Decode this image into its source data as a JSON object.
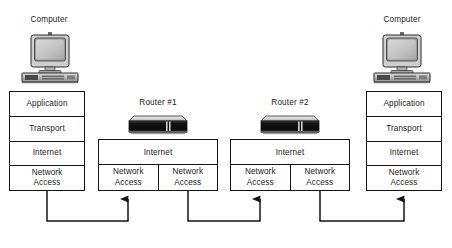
{
  "diagram": {
    "background_color": "#ffffff",
    "line_color": "#141414",
    "text_color": "#1d1d1d",
    "nodes": [
      {
        "id": "computer-a",
        "caption": "Computer\nA",
        "caption_line1": "Computer",
        "caption_line2": "A",
        "icon": "desktop-computer-icon",
        "layers": [
          "Application",
          "Transport",
          "Internet",
          "Network\nAccess"
        ]
      },
      {
        "id": "router-1",
        "caption": "Router #1",
        "icon": "router-icon",
        "internet_label": "Internet",
        "network_access_left": "Network\nAccess",
        "network_access_right": "Network\nAccess"
      },
      {
        "id": "router-2",
        "caption": "Router #2",
        "icon": "router-icon",
        "internet_label": "Internet",
        "network_access_left": "Network\nAccess",
        "network_access_right": "Network\nAccess"
      },
      {
        "id": "computer-b",
        "caption": "Computer\nB",
        "caption_line1": "Computer",
        "caption_line2": "B",
        "icon": "desktop-computer-icon",
        "layers": [
          "Application",
          "Transport",
          "Internet",
          "Network\nAccess"
        ]
      }
    ],
    "stack_a": {
      "layer_application": "Application",
      "layer_transport": "Transport",
      "layer_internet": "Internet",
      "layer_network_access": "Network\nAccess"
    },
    "stack_b": {
      "layer_application": "Application",
      "layer_transport": "Transport",
      "layer_internet": "Internet",
      "layer_network_access": "Network\nAccess"
    },
    "router1": {
      "caption": "Router #1",
      "internet": "Internet",
      "na_left": "Network\nAccess",
      "na_right": "Network\nAccess"
    },
    "router2": {
      "caption": "Router #2",
      "internet": "Internet",
      "na_left": "Network\nAccess",
      "na_right": "Network\nAccess"
    },
    "computer_a": {
      "caption_line1": "Computer",
      "caption_line2": "A"
    },
    "computer_b": {
      "caption_line1": "Computer",
      "caption_line2": "B"
    },
    "links": [
      {
        "id": "link-a-to-router1",
        "from": "computer-a.network-access",
        "to": "router-1.network-access-left",
        "arrow": "up"
      },
      {
        "id": "link-router1-to-router2",
        "from": "router-1.network-access-right",
        "to": "router-2.network-access-left",
        "arrow": "up"
      },
      {
        "id": "link-router2-to-b",
        "from": "router-2.network-access-right",
        "to": "computer-b.network-access",
        "arrow": "up"
      }
    ]
  }
}
